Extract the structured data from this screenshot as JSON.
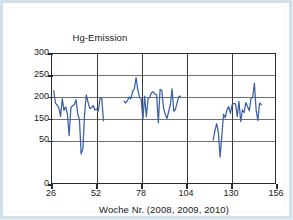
{
  "figure": {
    "border_color": "#cfe0ea",
    "background": "#ffffff"
  },
  "chart_data": {
    "type": "line",
    "title": "",
    "series_name": "Hg-Emission",
    "ylabel_line1": "Hg-Emission",
    "ylabel_line2_prefix": "µg/Nm",
    "ylabel_line2_sup": "3",
    "xlabel": "Woche Nr. (2008, 2009, 2010)",
    "line_color": "#3b5fa8",
    "grid": true,
    "grid_color_horizontal": "#6f6f6f",
    "grid_color_vertical": "#3a3a3a",
    "legend": "none",
    "xlim": [
      26,
      156
    ],
    "ylim": [
      0,
      300
    ],
    "xticks": [
      26,
      52,
      78,
      104,
      130,
      156
    ],
    "xticklabels": [
      "26",
      "52",
      "78",
      "104",
      "130",
      "156"
    ],
    "yticks": [
      0,
      100,
      150,
      200,
      250,
      300
    ],
    "yticklabels": [
      "0",
      "50",
      "150",
      "200",
      "250",
      "300"
    ],
    "ytick_note": "tick at value 100 is labelled '50' as printed in the source figure",
    "x": [
      27,
      28,
      29,
      30,
      31,
      32,
      33,
      34,
      35,
      36,
      37,
      38,
      39,
      40,
      41,
      42,
      43,
      44,
      45,
      46,
      47,
      48,
      49,
      50,
      51,
      52,
      53,
      54,
      55,
      56,
      68,
      69,
      70,
      71,
      72,
      73,
      74,
      75,
      76,
      77,
      78,
      79,
      80,
      81,
      82,
      83,
      84,
      85,
      86,
      87,
      88,
      89,
      90,
      91,
      92,
      93,
      94,
      95,
      96,
      97,
      98,
      99,
      100,
      101,
      120,
      121,
      122,
      123,
      124,
      125,
      126,
      127,
      128,
      129,
      130,
      131,
      132,
      133,
      134,
      135,
      136,
      137,
      138,
      139,
      140,
      141,
      142,
      143,
      144,
      145,
      146,
      147,
      148
    ],
    "values": [
      215,
      186,
      181,
      175,
      155,
      196,
      169,
      177,
      160,
      110,
      175,
      180,
      182,
      194,
      160,
      148,
      67,
      80,
      160,
      205,
      188,
      173,
      175,
      180,
      170,
      172,
      168,
      196,
      197,
      145,
      190,
      186,
      192,
      200,
      196,
      213,
      219,
      245,
      217,
      199,
      195,
      148,
      202,
      154,
      196,
      200,
      210,
      212,
      207,
      205,
      140,
      218,
      215,
      175,
      160,
      150,
      166,
      182,
      219,
      167,
      172,
      188,
      201,
      202,
      100,
      122,
      138,
      118,
      60,
      110,
      160,
      152,
      170,
      178,
      162,
      182,
      185,
      184,
      155,
      190,
      143,
      170,
      164,
      187,
      178,
      168,
      196,
      200,
      232,
      170,
      145,
      186,
      182
    ],
    "gaps": [
      {
        "after_week": 56,
        "before_week": 68
      },
      {
        "after_week": 101,
        "before_week": 120
      }
    ]
  }
}
